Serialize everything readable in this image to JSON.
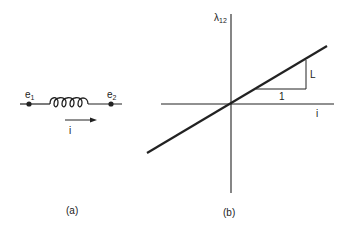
{
  "figure_a": {
    "caption": "(a)",
    "node_left_label": "e",
    "node_left_sub": "1",
    "node_right_label": "e",
    "node_right_sub": "2",
    "current_label": "i",
    "component": "inductor-coil"
  },
  "figure_b": {
    "caption": "(b)",
    "y_axis_label": "λ",
    "y_axis_sub": "12",
    "x_axis_label": "i",
    "slope_run_label": "1",
    "slope_rise_label": "L"
  },
  "colors": {
    "ink": "#222222",
    "background": "#ffffff"
  }
}
